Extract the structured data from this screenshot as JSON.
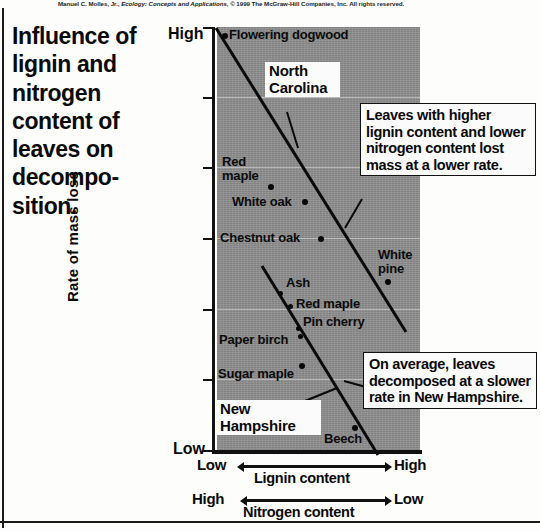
{
  "credit": "Manuel C. Molles, Jr., Ecology: Concepts and Applications, © 1999 The McGraw-Hill Companies, Inc. All rights reserved.",
  "credit_italic": "Ecology: Concepts and Applications",
  "title": "Influence of lignin and nitrogen content of leaves on decompo-sition.",
  "axes": {
    "y_title": "Rate of mass loss",
    "y_high": "High",
    "y_low": "Low",
    "lignin_left": "Low",
    "lignin_right": "High",
    "lignin_label": "Lignin content",
    "nitrogen_left": "High",
    "nitrogen_right": "Low",
    "nitrogen_label": "Nitrogen content"
  },
  "series_labels": {
    "north_carolina": "North Carolina",
    "new_hampshire": "New Hampshire"
  },
  "callouts": {
    "upper": "Leaves with higher lignin content and lower nitrogen content lost mass at a lower rate.",
    "lower": "On average, leaves decomposed at a slower rate in New Hampshire."
  },
  "colors": {
    "plot_background": "#8f8f8f",
    "ink": "#0a0a0a",
    "callout_background": "#fbfbfb",
    "gridline": "#c9c9c9"
  },
  "chart_data": {
    "type": "scatter",
    "xlabel": "Lignin content (Low to High) / Nitrogen content (High to Low)",
    "ylabel": "Rate of mass loss",
    "xlim": [
      "Low lignin / High nitrogen",
      "High lignin / Low nitrogen"
    ],
    "ylim": [
      "Low",
      "High"
    ],
    "grid": true,
    "legend": "inline labels",
    "series": [
      {
        "name": "North Carolina",
        "trendline": true,
        "points": [
          {
            "label": "Flowering dogwood",
            "x": 0.04,
            "y": 0.99
          },
          {
            "label": "Red maple",
            "x": 0.19,
            "y": 0.63
          },
          {
            "label": "White oak",
            "x": 0.27,
            "y": 0.56
          },
          {
            "label": "Chestnut oak",
            "x": 0.37,
            "y": 0.48
          },
          {
            "label": "White pine",
            "x": 0.83,
            "y": 0.29
          }
        ]
      },
      {
        "name": "New Hampshire",
        "trendline": true,
        "points": [
          {
            "label": "Ash",
            "x": 0.24,
            "y": 0.37
          },
          {
            "label": "Red maple",
            "x": 0.28,
            "y": 0.31
          },
          {
            "label": "Pin cherry",
            "x": 0.33,
            "y": 0.22
          },
          {
            "label": "Paper birch",
            "x": 0.34,
            "y": 0.2
          },
          {
            "label": "Sugar maple",
            "x": 0.42,
            "y": 0.12
          },
          {
            "label": "Beech",
            "x": 0.71,
            "y": 0.015
          }
        ]
      }
    ],
    "annotations": [
      "Leaves with higher lignin content and lower nitrogen content lost mass at a lower rate.",
      "On average, leaves decomposed at a slower rate in New Hampshire."
    ]
  }
}
